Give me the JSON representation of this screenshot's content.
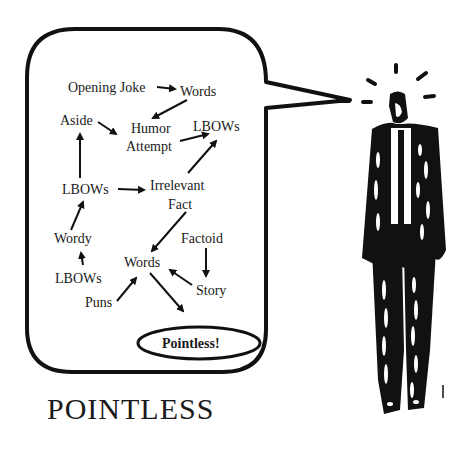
{
  "title": "POINTLESS",
  "bubble": {
    "nodes": [
      {
        "id": "opening-joke",
        "label": "Opening Joke",
        "x": 68,
        "y": 92
      },
      {
        "id": "words-1",
        "label": "Words",
        "x": 180,
        "y": 96
      },
      {
        "id": "aside",
        "label": "Aside",
        "x": 60,
        "y": 125
      },
      {
        "id": "humor",
        "label": "Humor",
        "x": 130,
        "y": 133
      },
      {
        "id": "attempt",
        "label": "Attempt",
        "x": 125,
        "y": 151
      },
      {
        "id": "lbows-1",
        "label": "LBOWs",
        "x": 193,
        "y": 132
      },
      {
        "id": "lbows-2",
        "label": "LBOWs",
        "x": 62,
        "y": 194
      },
      {
        "id": "irrelevant",
        "label": "Irrelevant",
        "x": 150,
        "y": 190
      },
      {
        "id": "fact",
        "label": "Fact",
        "x": 168,
        "y": 210
      },
      {
        "id": "wordy",
        "label": "Wordy",
        "x": 53,
        "y": 244
      },
      {
        "id": "factoid",
        "label": "Factoid",
        "x": 180,
        "y": 244
      },
      {
        "id": "words-2",
        "label": "Words",
        "x": 124,
        "y": 267
      },
      {
        "id": "lbows-3",
        "label": "LBOWs",
        "x": 54,
        "y": 283
      },
      {
        "id": "story",
        "label": "Story",
        "x": 196,
        "y": 295
      },
      {
        "id": "puns",
        "label": "Puns",
        "x": 84,
        "y": 307
      }
    ],
    "final_node": {
      "label": "Pointless!"
    },
    "edges": [
      [
        "opening-joke",
        "words-1"
      ],
      [
        "words-1",
        "humor"
      ],
      [
        "aside",
        "attempt"
      ],
      [
        "attempt",
        "lbows-1"
      ],
      [
        "lbows-2",
        "aside"
      ],
      [
        "lbows-2",
        "irrelevant"
      ],
      [
        "irrelevant",
        "lbows-1"
      ],
      [
        "fact",
        "words-2"
      ],
      [
        "wordy",
        "lbows-2"
      ],
      [
        "lbows-3",
        "wordy"
      ],
      [
        "factoid",
        "story"
      ],
      [
        "story",
        "words-2"
      ],
      [
        "puns",
        "words-2"
      ],
      [
        "words-2",
        "pointless"
      ]
    ]
  },
  "colors": {
    "ink": "#111111",
    "background": "#ffffff"
  }
}
